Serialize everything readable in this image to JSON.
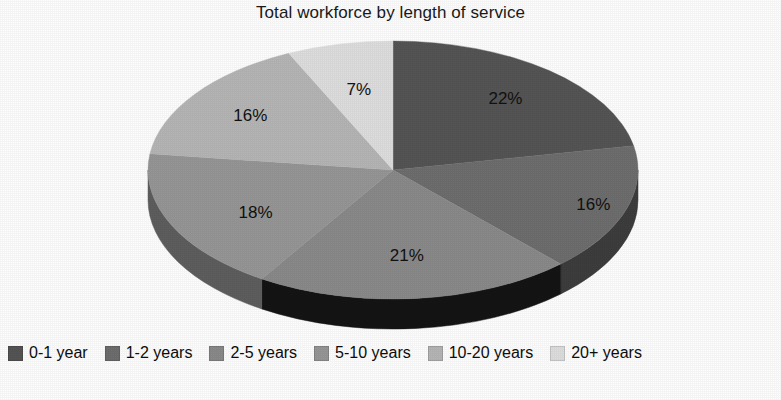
{
  "chart_data": {
    "type": "pie",
    "title": "Total workforce by length of service",
    "xlabel": "",
    "ylabel": "",
    "legend_position": "bottom",
    "three_d": true,
    "categories": [
      "0-1 year",
      "1-2 years",
      "2-5 years",
      "5-10 years",
      "10-20 years",
      "20+ years"
    ],
    "values": [
      22,
      16,
      21,
      18,
      16,
      7
    ],
    "value_labels": [
      "22%",
      "16%",
      "21%",
      "18%",
      "16%",
      "7%"
    ],
    "colors": [
      "#555555",
      "#6e6e6e",
      "#8a8a8a",
      "#969696",
      "#b6b6b6",
      "#dedede"
    ],
    "side_colors": [
      "#2b2b2b",
      "#3d3d3d",
      "#141414",
      "#5e5e5e",
      "#6f6f6f",
      "#9a9a9a"
    ],
    "slices": [
      {
        "label": "0-1 year",
        "value": 22,
        "value_label": "22%",
        "color": "#555555",
        "side_color": "#2b2b2b"
      },
      {
        "label": "1-2 years",
        "value": 16,
        "value_label": "16%",
        "color": "#6e6e6e",
        "side_color": "#3d3d3d"
      },
      {
        "label": "2-5 years",
        "value": 21,
        "value_label": "21%",
        "color": "#8a8a8a",
        "side_color": "#141414"
      },
      {
        "label": "5-10 years",
        "value": 18,
        "value_label": "18%",
        "color": "#969696",
        "side_color": "#5e5e5e"
      },
      {
        "label": "10-20 years",
        "value": 16,
        "value_label": "16%",
        "color": "#b6b6b6",
        "side_color": "#6f6f6f"
      },
      {
        "label": "20+ years",
        "value": 7,
        "value_label": "7%",
        "color": "#dedede",
        "side_color": "#9a9a9a"
      }
    ]
  },
  "title": {
    "text": "Total workforce by length of service"
  },
  "labels": {
    "slice_0": "22%",
    "slice_1": "16%",
    "slice_2": "21%",
    "slice_3": "18%",
    "slice_4": "16%",
    "slice_5": "7%"
  },
  "legend": {
    "items": [
      {
        "label": "0-1 year",
        "color": "#555555"
      },
      {
        "label": "1-2 years",
        "color": "#6e6e6e"
      },
      {
        "label": "2-5 years",
        "color": "#8a8a8a"
      },
      {
        "label": "5-10 years",
        "color": "#969696"
      },
      {
        "label": "10-20 years",
        "color": "#b6b6b6"
      },
      {
        "label": "20+ years",
        "color": "#dedede"
      }
    ]
  }
}
